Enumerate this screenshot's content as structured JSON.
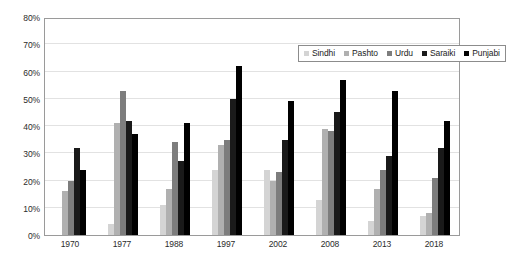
{
  "chart_data": {
    "type": "bar",
    "title": "",
    "subtitle": "",
    "xlabel": "",
    "ylabel": "",
    "ylim": [
      0,
      80
    ],
    "ytick_labels": [
      "0%",
      "10%",
      "20%",
      "30%",
      "40%",
      "50%",
      "60%",
      "70%",
      "80%"
    ],
    "ytick_values": [
      0,
      10,
      20,
      30,
      40,
      50,
      60,
      70,
      80
    ],
    "grid": true,
    "legend_position": "top-right",
    "categories": [
      "1970",
      "1977",
      "1988",
      "1997",
      "2002",
      "2008",
      "2013",
      "2018"
    ],
    "series": [
      {
        "name": "Sindhi",
        "color": "#d4d4d4",
        "values": [
          null,
          4,
          11,
          24,
          24,
          13,
          5,
          7
        ]
      },
      {
        "name": "Pashto",
        "color": "#b0b0b0",
        "values": [
          16,
          41,
          17,
          33,
          20,
          39,
          17,
          8
        ]
      },
      {
        "name": "Urdu",
        "color": "#7d7d7d",
        "values": [
          20,
          53,
          34,
          35,
          23,
          38,
          24,
          21
        ]
      },
      {
        "name": "Saraiki",
        "color": "#1a1a1a",
        "values": [
          32,
          42,
          27,
          50,
          35,
          45,
          29,
          32
        ]
      },
      {
        "name": "Punjabi",
        "color": "#000000",
        "values": [
          24,
          37,
          41,
          62,
          49,
          57,
          53,
          42
        ]
      }
    ]
  },
  "legend": {
    "items": [
      {
        "label": "Sindhi"
      },
      {
        "label": "Pashto"
      },
      {
        "label": "Urdu"
      },
      {
        "label": "Saraiki"
      },
      {
        "label": "Punjabi"
      }
    ]
  }
}
